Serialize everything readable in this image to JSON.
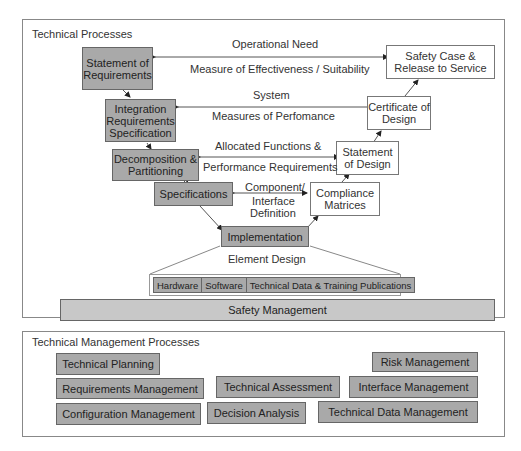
{
  "technical_processes": {
    "title": "Technical Processes",
    "left_boxes": {
      "statement_of_requirements": "Statement of Requirements",
      "integration_requirements_specification": "Integration Requirements Specification",
      "decomposition_partitioning": "Decomposition & Partitioning",
      "specifications": "Specifications",
      "implementation": "Implementation"
    },
    "right_boxes": {
      "safety_case": "Safety Case & Release to Service",
      "certificate_of_design": "Certificate of Design",
      "statement_of_design": "Statement of Design",
      "compliance_matrices": "Compliance Matrices"
    },
    "link_labels": {
      "operational_need": "Operational Need",
      "measure_of_effectiveness": "Measure of Effectiveness / Suitability",
      "system": "System",
      "measures_of_performance": "Measures of Perfomance",
      "allocated_functions": "Allocated Functions &",
      "performance_requirements": "Performance Requirements",
      "component_interface_1": "Component/",
      "component_interface_2": "Interface",
      "component_interface_3": "Definition"
    },
    "element_design": {
      "label": "Element Design",
      "items": [
        "Hardware",
        "Software",
        "Technical Data & Training Publications"
      ]
    },
    "safety_management": "Safety Management"
  },
  "technical_management_processes": {
    "title": "Technical Management Processes",
    "items": {
      "technical_planning": "Technical Planning",
      "risk_management": "Risk Management",
      "requirements_management": "Requirements Management",
      "technical_assessment": "Technical Assessment",
      "interface_management": "Interface Management",
      "configuration_management": "Configuration Management",
      "decision_analysis": "Decision Analysis",
      "technical_data_management": "Technical Data Management"
    }
  }
}
